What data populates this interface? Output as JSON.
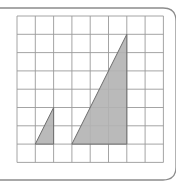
{
  "figure": {
    "grid": {
      "columns": 8,
      "rows": 8
    },
    "colors": {
      "frame": "#8c8c8c",
      "grid_line": "#9a9a9a",
      "triangle_fill": "#b3b3b3",
      "triangle_stroke": "#6e6e6e",
      "background": "#ffffff"
    },
    "triangles": [
      {
        "name": "small-triangle",
        "vertices": [
          [
            1,
            7
          ],
          [
            2,
            7
          ],
          [
            2,
            5
          ]
        ]
      },
      {
        "name": "large-triangle",
        "vertices": [
          [
            3,
            7
          ],
          [
            6,
            7
          ],
          [
            6,
            1
          ]
        ]
      }
    ]
  }
}
